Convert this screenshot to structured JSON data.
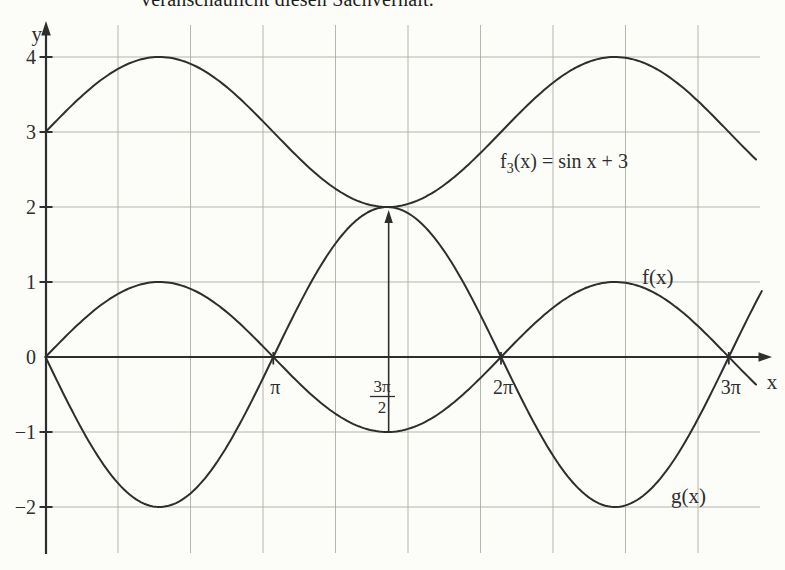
{
  "caption": {
    "text": "veranschaulicht diesen Sachverhalt."
  },
  "colors": {
    "ink": "#2e2e2e",
    "grid": "#a8ac9f",
    "background": "#fcfcf9"
  },
  "chart_data": {
    "type": "line",
    "title": "",
    "xlabel": "x",
    "ylabel": "y",
    "x_unit": "radians",
    "xlim": [
      0,
      10.2
    ],
    "ylim": [
      -2.8,
      4.6
    ],
    "grid": true,
    "legend_position": "inline-labels",
    "x_gridlines": [
      1,
      2,
      3,
      4,
      5,
      6,
      7,
      8,
      9
    ],
    "y_gridlines": [
      -2,
      -1,
      1,
      2,
      3,
      4
    ],
    "y_ticks": [
      {
        "v": 4,
        "label": "4"
      },
      {
        "v": 3,
        "label": "3"
      },
      {
        "v": 2,
        "label": "2"
      },
      {
        "v": 1,
        "label": "1"
      },
      {
        "v": 0,
        "label": "0"
      },
      {
        "v": -1,
        "label": "−1"
      },
      {
        "v": -2,
        "label": "−2"
      }
    ],
    "x_ticks": [
      {
        "u": 3.14159,
        "label": "π"
      },
      {
        "u": 6.28319,
        "label": "2π"
      },
      {
        "u": 9.42478,
        "label": "3π"
      }
    ],
    "x_tick_fraction": {
      "u": 4.71239,
      "numerator": "3π",
      "denominator": "2"
    },
    "series": [
      {
        "id": "f3",
        "label_base": "f",
        "label_sub": "3",
        "label_rest": "(x) = sin x + 3",
        "formula": "sin(x) + 3",
        "amplitude": 1,
        "offset": 3,
        "x_start": 0,
        "x_end": 9.83,
        "key_points": [
          [
            0,
            3
          ],
          [
            1.5708,
            4
          ],
          [
            3.1416,
            3
          ],
          [
            4.7124,
            2
          ],
          [
            6.2832,
            3
          ],
          [
            7.854,
            4
          ],
          [
            9.4248,
            3
          ]
        ]
      },
      {
        "id": "f",
        "label": "f(x)",
        "formula": "sin(x)",
        "amplitude": 1,
        "offset": 0,
        "x_start": 0,
        "x_end": 9.83,
        "key_points": [
          [
            0,
            0
          ],
          [
            1.5708,
            1
          ],
          [
            3.1416,
            0
          ],
          [
            4.7124,
            -1
          ],
          [
            6.2832,
            0
          ],
          [
            7.854,
            1
          ],
          [
            9.4248,
            0
          ]
        ]
      },
      {
        "id": "g",
        "label": "g(x)",
        "formula": "-2·sin(x)",
        "amplitude": -2,
        "offset": 0,
        "x_start": 0,
        "x_end": 9.9,
        "key_points": [
          [
            0,
            0
          ],
          [
            1.5708,
            -2
          ],
          [
            3.1416,
            0
          ],
          [
            4.7124,
            2
          ],
          [
            6.2832,
            0
          ],
          [
            7.854,
            -2
          ],
          [
            9.4248,
            0
          ]
        ]
      }
    ],
    "annotation_arrow": {
      "x": 4.71239,
      "from_y": -1,
      "to_y": 2
    }
  }
}
